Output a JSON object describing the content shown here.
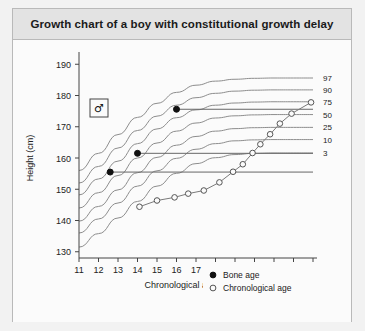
{
  "figure": {
    "title": "Growth chart of a boy with constitutional growth delay",
    "sex_symbol": "♂"
  },
  "chart_data": {
    "type": "line",
    "title": "Growth chart of a boy with constitutional growth delay",
    "xlabel": "Chronological age (years)",
    "ylabel": "Height (cm)",
    "xlim": [
      11,
      23
    ],
    "ylim": [
      128,
      192
    ],
    "xticks": [
      11,
      12,
      13,
      14,
      15,
      16,
      17,
      18,
      19,
      20,
      21,
      22,
      23
    ],
    "yticks": [
      130,
      140,
      150,
      160,
      170,
      180,
      190
    ],
    "grid": false,
    "legend_position": "bottom-right",
    "reference_label": "Percentile",
    "centiles": [
      {
        "label": "97",
        "label_value": 97,
        "x": [
          11,
          12,
          13,
          14,
          15,
          16,
          17,
          18,
          19,
          20,
          21,
          22,
          23
        ],
        "y": [
          156.0,
          161.5,
          167.5,
          173.0,
          177.5,
          181.0,
          183.3,
          184.6,
          185.2,
          185.5,
          185.6,
          185.6,
          185.6
        ]
      },
      {
        "label": "90",
        "label_value": 90,
        "x": [
          11,
          12,
          13,
          14,
          15,
          16,
          17,
          18,
          19,
          20,
          21,
          22,
          23
        ],
        "y": [
          152.0,
          157.3,
          163.2,
          168.8,
          173.4,
          176.9,
          179.3,
          180.7,
          181.4,
          181.7,
          181.8,
          181.8,
          181.8
        ]
      },
      {
        "label": "75",
        "label_value": 75,
        "x": [
          11,
          12,
          13,
          14,
          15,
          16,
          17,
          18,
          19,
          20,
          21,
          22,
          23
        ],
        "y": [
          148.2,
          153.3,
          159.0,
          164.6,
          169.3,
          172.9,
          175.4,
          176.9,
          177.6,
          177.9,
          178.0,
          178.0,
          178.0
        ]
      },
      {
        "label": "50",
        "label_value": 50,
        "x": [
          11,
          12,
          13,
          14,
          15,
          16,
          17,
          18,
          19,
          20,
          21,
          22,
          23
        ],
        "y": [
          144.0,
          148.9,
          154.4,
          160.0,
          164.8,
          168.6,
          171.2,
          172.8,
          173.5,
          173.8,
          173.9,
          173.9,
          173.9
        ]
      },
      {
        "label": "25",
        "label_value": 25,
        "x": [
          11,
          12,
          13,
          14,
          15,
          16,
          17,
          18,
          19,
          20,
          21,
          22,
          23
        ],
        "y": [
          139.8,
          144.5,
          149.8,
          155.3,
          160.2,
          164.1,
          166.9,
          168.6,
          169.4,
          169.7,
          169.8,
          169.8,
          169.8
        ]
      },
      {
        "label": "10",
        "label_value": 10,
        "x": [
          11,
          12,
          13,
          14,
          15,
          16,
          17,
          18,
          19,
          20,
          21,
          22,
          23
        ],
        "y": [
          136.0,
          140.5,
          145.6,
          151.0,
          155.9,
          159.9,
          162.8,
          164.6,
          165.5,
          165.8,
          165.9,
          165.9,
          165.9
        ]
      },
      {
        "label": "3",
        "label_value": 3,
        "x": [
          11,
          12,
          13,
          14,
          15,
          16,
          17,
          18,
          19,
          20,
          21,
          22,
          23
        ],
        "y": [
          131.5,
          135.8,
          140.8,
          146.1,
          151.0,
          155.1,
          158.2,
          160.1,
          161.1,
          161.5,
          161.6,
          161.6,
          161.6
        ]
      }
    ],
    "series": [
      {
        "name": "Bone age",
        "marker": "filled-circle",
        "points": [
          {
            "x": 12.6,
            "y": 155.5
          },
          {
            "x": 14.0,
            "y": 161.5
          },
          {
            "x": 16.0,
            "y": 175.6
          }
        ],
        "connector_lines_to_x": 23
      },
      {
        "name": "Chronological age",
        "marker": "open-circle",
        "x": [
          14.1,
          15.0,
          15.9,
          16.6,
          17.4,
          18.2,
          18.9,
          19.4,
          19.9,
          20.3,
          20.8,
          21.3,
          21.9,
          22.9
        ],
        "y": [
          144.4,
          146.4,
          147.4,
          148.6,
          149.6,
          152.2,
          155.6,
          158.0,
          161.6,
          164.4,
          167.6,
          171.0,
          174.2,
          177.8
        ]
      }
    ],
    "legend": [
      {
        "label": "Bone age",
        "marker": "filled-circle"
      },
      {
        "label": "Chronological age",
        "marker": "open-circle"
      }
    ]
  }
}
